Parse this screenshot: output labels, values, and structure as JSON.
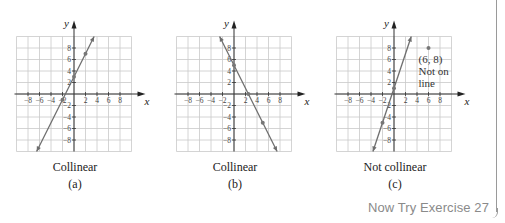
{
  "panels": [
    {
      "title": "Collinear",
      "label": "(a)"
    },
    {
      "title": "Collinear",
      "label": "(b)"
    },
    {
      "title": "Not collinear",
      "label": "(c)"
    }
  ],
  "annotation_c": {
    "point": "(6, 8)",
    "line1": "Not on",
    "line2": "line"
  },
  "axis_labels": {
    "x": "x",
    "y": "y"
  },
  "footer": {
    "exercise_link": "Now Try Exercise 27"
  },
  "chart_data": [
    {
      "type": "line",
      "title": "Collinear",
      "label": "(a)",
      "xlabel": "x",
      "ylabel": "y",
      "xlim": [
        -10,
        10
      ],
      "ylim": [
        -10,
        10
      ],
      "x_ticks": [
        -8,
        -6,
        -4,
        -2,
        2,
        4,
        6,
        8
      ],
      "y_ticks": [
        -8,
        -6,
        -4,
        -2,
        2,
        4,
        6,
        8
      ],
      "grid": true,
      "line": {
        "equation": "y = 2x + 3",
        "slope": 2,
        "intercept": 3
      },
      "points": [
        [
          -2,
          -1
        ],
        [
          0,
          3
        ],
        [
          2,
          7
        ]
      ]
    },
    {
      "type": "line",
      "title": "Collinear",
      "label": "(b)",
      "xlabel": "x",
      "ylabel": "y",
      "xlim": [
        -10,
        10
      ],
      "ylim": [
        -10,
        10
      ],
      "x_ticks": [
        -8,
        -6,
        -4,
        -2,
        2,
        4,
        6,
        8
      ],
      "y_ticks": [
        -8,
        -6,
        -4,
        -2,
        2,
        4,
        6,
        8
      ],
      "grid": true,
      "line": {
        "equation": "y = -2x + 5",
        "slope": -2,
        "intercept": 5
      },
      "points": [
        [
          0,
          5
        ],
        [
          2.5,
          0
        ],
        [
          5,
          -5
        ]
      ]
    },
    {
      "type": "line",
      "title": "Not collinear",
      "label": "(c)",
      "xlabel": "x",
      "ylabel": "y",
      "xlim": [
        -10,
        10
      ],
      "ylim": [
        -10,
        10
      ],
      "x_ticks": [
        -8,
        -6,
        -4,
        -2,
        2,
        4,
        6,
        8
      ],
      "y_ticks": [
        -8,
        -6,
        -4,
        -2,
        2,
        4,
        6,
        8
      ],
      "grid": true,
      "line": {
        "equation": "y = 3x + 1",
        "slope": 3,
        "intercept": 1
      },
      "points": [
        [
          -2,
          -5
        ],
        [
          0,
          1
        ]
      ],
      "off_line_points": [
        [
          6,
          8
        ]
      ],
      "annotations": [
        "(6, 8)",
        "Not on line"
      ]
    }
  ]
}
